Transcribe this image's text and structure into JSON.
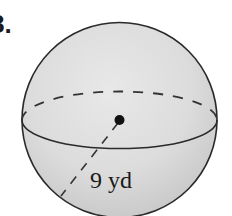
{
  "problem": {
    "number_label": "8."
  },
  "figure": {
    "shape": "sphere",
    "radius_label": "9 yd",
    "colors": {
      "background": "#ffffff",
      "sphere_fill_light": "#e6e6e6",
      "sphere_fill_dark": "#c9c9c9",
      "outline": "#2a2a2a",
      "center_dot": "#111111"
    }
  }
}
